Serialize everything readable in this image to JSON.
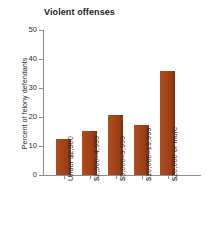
{
  "chart_data": {
    "type": "bar",
    "title": "Violent offenses",
    "xlabel": "",
    "ylabel": "Percent of felony defendants",
    "categories": [
      "Under $2,500",
      "$2,500–4,999",
      "$5,000–9,999",
      "$10,000–19,999",
      "$20,000 or more"
    ],
    "values": [
      12.4,
      15.2,
      20.7,
      17.2,
      35.9
    ],
    "ylim": [
      0,
      50
    ],
    "yticks": [
      0,
      10,
      20,
      30,
      40,
      50
    ],
    "ytick_labels": [
      "0",
      "10",
      "20",
      "30",
      "40",
      "50"
    ],
    "grid": false,
    "legend": null,
    "bar_color": "#a3441a",
    "bar_edge_color": "#7d3111",
    "axis_color": "#8d8d8d",
    "text_color": "#2b2b2b"
  }
}
